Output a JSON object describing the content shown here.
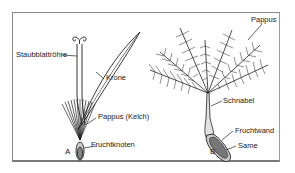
{
  "figure": {
    "panels": [
      {
        "id": "A",
        "label": "A",
        "description": "Einzelblüte (Röhrenblüte)",
        "parts": [
          {
            "name": "staubblattroehre",
            "label": "Staubblattröhre"
          },
          {
            "name": "krone",
            "label": "Krone"
          },
          {
            "name": "pappus-kelch",
            "label": "Pappus (Kelch)"
          },
          {
            "name": "fruchtknoten",
            "label": "Fruchtknoten"
          }
        ]
      },
      {
        "id": "B",
        "label": "B",
        "description": "Frucht mit Pappus (Flugschirm)",
        "parts": [
          {
            "name": "pappus",
            "label": "Pappus"
          },
          {
            "name": "schnabel",
            "label": "Schnabel"
          },
          {
            "name": "fruchtwand",
            "label": "Fruchtwand"
          },
          {
            "name": "same",
            "label": "Same"
          }
        ]
      }
    ],
    "colors": {
      "line": "#222222",
      "frame": "#8a8a8a",
      "seed_fill": "#777777",
      "wall_fill": "#c8c8c8",
      "beak_fill": "#e2e2e2"
    }
  }
}
